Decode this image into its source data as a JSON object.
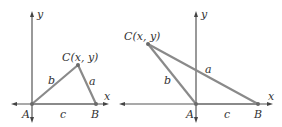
{
  "figures": [
    {
      "name": "acute-triangle",
      "axes": {
        "x_label": "x",
        "y_label": "y"
      },
      "vertices": {
        "A": {
          "label": "A"
        },
        "B": {
          "label": "B"
        },
        "C": {
          "label": "C(x, y)"
        }
      },
      "sides": {
        "a": "a",
        "b": "b",
        "c": "c"
      }
    },
    {
      "name": "obtuse-triangle",
      "axes": {
        "x_label": "x",
        "y_label": "y"
      },
      "vertices": {
        "A": {
          "label": "A"
        },
        "B": {
          "label": "B"
        },
        "C": {
          "label": "C(x, y)"
        }
      },
      "sides": {
        "a": "a",
        "b": "b",
        "c": "c"
      }
    }
  ],
  "colors": {
    "axis": "#555555",
    "side": "#8a8a8a",
    "text": "#333333"
  }
}
